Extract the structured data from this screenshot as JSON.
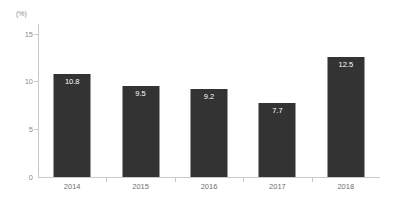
{
  "chart_data": {
    "type": "bar",
    "title": "",
    "subtitle": "",
    "xlabel": "",
    "ylabel": "",
    "unit_label": "(%)",
    "categories": [
      "2014",
      "2015",
      "2016",
      "2017",
      "2018"
    ],
    "values": [
      10.8,
      9.5,
      9.2,
      7.7,
      12.5
    ],
    "value_labels": [
      "10.8",
      "9.5",
      "9.2",
      "7.7",
      "12.5"
    ],
    "ylim": [
      0,
      16
    ],
    "yticks": [
      0,
      5,
      10,
      15
    ],
    "ytick_labels": [
      "0",
      "5",
      "10",
      "15"
    ],
    "grid": false,
    "legend": false,
    "legend_position": "none",
    "bar_color": "#333333",
    "value_label_color": "#ffffff",
    "axis_color": "#c9c9c9",
    "tick_label_color": "#8c8c8c",
    "category_label_color": "#6f6f6f"
  }
}
